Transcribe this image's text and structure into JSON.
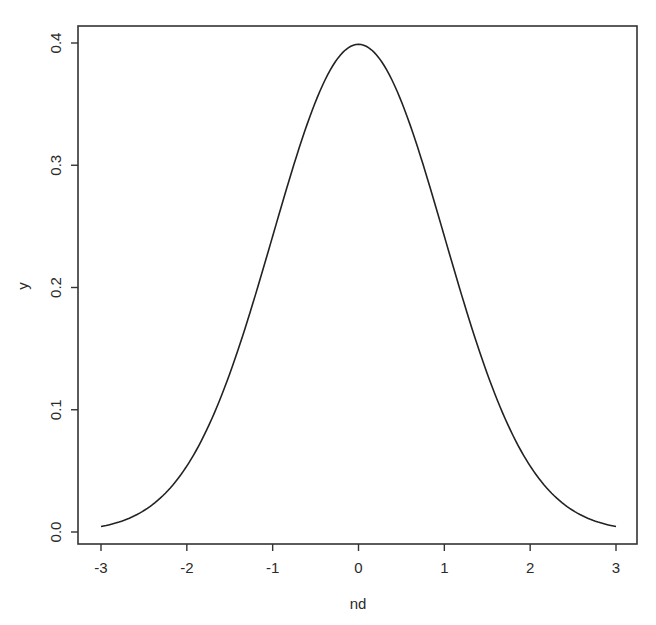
{
  "chart_data": {
    "type": "line",
    "title": "",
    "xlabel": "nd",
    "ylabel": "y",
    "xlim": [
      -3,
      3
    ],
    "ylim": [
      0,
      0.4
    ],
    "grid": false,
    "legend": null,
    "x_ticks": [
      -3,
      -2,
      -1,
      0,
      1,
      2,
      3
    ],
    "x_tick_labels": [
      "-3",
      "-2",
      "-1",
      "0",
      "1",
      "2",
      "3"
    ],
    "y_ticks": [
      0.0,
      0.1,
      0.2,
      0.3,
      0.4
    ],
    "y_tick_labels": [
      "0.0",
      "0.1",
      "0.2",
      "0.3",
      "0.4"
    ],
    "series": [
      {
        "name": "y",
        "description": "standard normal density",
        "x": [
          -3.0,
          -2.5,
          -2.0,
          -1.5,
          -1.0,
          -0.5,
          0.0,
          0.5,
          1.0,
          1.5,
          2.0,
          2.5,
          3.0
        ],
        "values": [
          0.0044,
          0.0175,
          0.054,
          0.1295,
          0.242,
          0.3521,
          0.3989,
          0.3521,
          0.242,
          0.1295,
          0.054,
          0.0175,
          0.0044
        ]
      }
    ]
  }
}
